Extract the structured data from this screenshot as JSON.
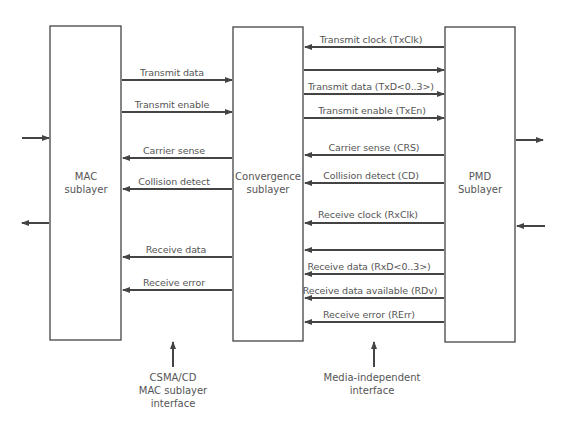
{
  "diagram": {
    "colors": {
      "line": "#444444",
      "text": "#555555",
      "background": "#ffffff"
    },
    "blocks": {
      "mac": {
        "line1": "MAC",
        "line2": "sublayer"
      },
      "convergence": {
        "line1": "Convergence",
        "line2": "sublayer"
      },
      "pmd": {
        "line1": "PMD",
        "line2": "Sublayer"
      }
    },
    "mac_interface_signals": [
      {
        "label": "Transmit data",
        "direction": "right"
      },
      {
        "label": "Transmit enable",
        "direction": "right"
      },
      {
        "label": "Carrier sense",
        "direction": "left"
      },
      {
        "label": "Collision detect",
        "direction": "left"
      },
      {
        "label": "Receive data",
        "direction": "left"
      },
      {
        "label": "Receive error",
        "direction": "left"
      }
    ],
    "mii_signals": [
      {
        "label": "Transmit clock (TxClk)",
        "direction": "left"
      },
      {
        "label": "",
        "direction": "right"
      },
      {
        "label": "Transmit data (TxD<0..3>)",
        "direction": "right"
      },
      {
        "label": "Transmit enable (TxEn)",
        "direction": "right"
      },
      {
        "label": "Carrier sense (CRS)",
        "direction": "left"
      },
      {
        "label": "Collision detect (CD)",
        "direction": "left"
      },
      {
        "label": "Receive clock (RxClk)",
        "direction": "left"
      },
      {
        "label": "",
        "direction": "left"
      },
      {
        "label": "Receive data (RxD<0..3>)",
        "direction": "left"
      },
      {
        "label": "Receive data available (RDv)",
        "direction": "left"
      },
      {
        "label": "Receive error (RErr)",
        "direction": "left"
      }
    ],
    "captions": {
      "mac_interface": {
        "line1": "CSMA/CD",
        "line2": "MAC sublayer",
        "line3": "interface"
      },
      "mii": {
        "line1": "Media-independent",
        "line2": "interface"
      }
    }
  }
}
